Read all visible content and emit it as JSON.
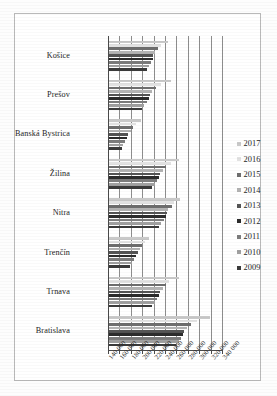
{
  "chart_data": {
    "type": "bar",
    "orientation": "horizontal",
    "title": "",
    "xlabel": "",
    "ylabel": "",
    "grid": true,
    "legend_position": "right",
    "xlim": [
      140000,
      340000
    ],
    "xticks": [
      140000,
      160000,
      180000,
      200000,
      220000,
      240000,
      260000,
      280000,
      300000,
      320000,
      340000
    ],
    "xtick_labels": [
      "140 000",
      "160 000",
      "180 000",
      "200 000",
      "220 000",
      "240 000",
      "260 000",
      "280 000",
      "300 000",
      "320 000",
      "340 000"
    ],
    "categories": [
      "Košice",
      "Prešov",
      "Banská Bystrica",
      "Žilina",
      "Nitra",
      "Trenčín",
      "Trnava",
      "Bratislava"
    ],
    "series": [
      {
        "name": "2017",
        "values": [
          244000,
          248000,
          196000,
          262000,
          264000,
          210000,
          262000,
          318000
        ]
      },
      {
        "name": "2016",
        "values": [
          232000,
          232000,
          188000,
          248000,
          254000,
          204000,
          246000,
          294000
        ]
      },
      {
        "name": "2015",
        "values": [
          226000,
          222000,
          182000,
          240000,
          250000,
          198000,
          240000,
          284000
        ]
      },
      {
        "name": "2014",
        "values": [
          220000,
          216000,
          178000,
          234000,
          244000,
          194000,
          234000,
          276000
        ]
      },
      {
        "name": "2013",
        "values": [
          218000,
          212000,
          174000,
          230000,
          242000,
          190000,
          230000,
          272000
        ]
      },
      {
        "name": "2012",
        "values": [
          218000,
          210000,
          172000,
          228000,
          240000,
          188000,
          228000,
          270000
        ]
      },
      {
        "name": "2011",
        "values": [
          214000,
          206000,
          168000,
          224000,
          236000,
          184000,
          224000,
          266000
        ]
      },
      {
        "name": "2010",
        "values": [
          210000,
          202000,
          164000,
          220000,
          232000,
          180000,
          220000,
          262000
        ]
      },
      {
        "name": "2009",
        "values": [
          206000,
          198000,
          162000,
          216000,
          228000,
          176000,
          216000,
          258000
        ]
      }
    ]
  },
  "legend": {
    "items": [
      {
        "label": "2017"
      },
      {
        "label": "2016"
      },
      {
        "label": "2015"
      },
      {
        "label": "2014"
      },
      {
        "label": "2013"
      },
      {
        "label": "2012"
      },
      {
        "label": "2011"
      },
      {
        "label": "2010"
      },
      {
        "label": "2009"
      }
    ]
  }
}
